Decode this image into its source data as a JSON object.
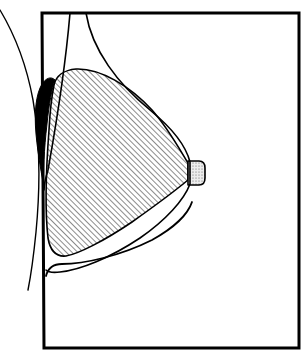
{
  "figure": {
    "domain": "Diagram",
    "background_color": "#ffffff",
    "stroke_color": "#000000",
    "canvas": {
      "width": 307,
      "height": 360
    }
  },
  "frame": {
    "label": "diagram border rectangle",
    "stroke_color": "#000000",
    "stroke_width": 3,
    "fill": "none",
    "corners": {
      "top_left": [
        42,
        13
      ],
      "top_right": [
        299,
        13
      ],
      "bottom_right": [
        299,
        348
      ],
      "bottom_left": [
        44,
        348
      ]
    }
  },
  "shapes": {
    "hatched_region": {
      "label": "hatched glandular region",
      "fill_pattern": "diagonal-hatch",
      "hatch_angle_deg": 45,
      "hatch_spacing_px": 4,
      "hatch_stroke_color": "#000000",
      "hatch_stroke_width": 0.9,
      "outline_stroke_width": 1.6,
      "path": "M 54 85 C 56 76, 64 70, 76 69 C 100 68, 130 86, 152 110 C 168 128, 180 150, 188 163 L 188 180 C 176 190, 156 205, 132 222 C 104 241, 78 254, 66 256 C 56 257, 50 250, 48 238 C 45 212, 46 170, 49 130 C 50 110, 52 95, 54 85 Z"
    },
    "black_wedge": {
      "label": "solid black crescent wedge",
      "fill": "#000000",
      "stroke": "#000000",
      "stroke_width": 1,
      "path": "M 55 80 C 52 88, 49 104, 47 124 C 44 150, 43 172, 44 188 C 42 176, 38 156, 36 134 C 34 112, 36 94, 42 84 C 46 78, 51 76, 55 80 Z"
    },
    "nipple": {
      "label": "nipple",
      "fill_pattern": "stipple-dots",
      "fill_color": "#e8e8e8",
      "dot_color": "#555555",
      "stroke_color": "#000000",
      "stroke_width": 1.6,
      "path": "M 188 161 L 199 161 C 203 161, 205 164, 205 168 L 205 178 C 205 182, 203 185, 199 185 L 188 185 Z"
    }
  },
  "curves": {
    "skin_outer_contour": {
      "label": "outer breast skin contour",
      "stroke_color": "#000000",
      "stroke_width": 1.6,
      "fill": "none",
      "path": "M 86 13 C 92 50, 118 84, 150 110 C 172 128, 186 146, 190 162 L 190 184 C 184 200, 166 220, 140 238 C 110 258, 80 270, 60 272 C 52 273, 48 272, 46 270"
    },
    "chest_wall_line": {
      "label": "chest wall vertical line",
      "stroke_color": "#000000",
      "stroke_width": 1.6,
      "fill": "none",
      "path": "M 70 13 C 66 60, 57 120, 48 170 C 45 180, 44 186, 44 190"
    },
    "torso_outer_curve": {
      "label": "outer torso silhouette curve",
      "stroke_color": "#000000",
      "stroke_width": 1.4,
      "fill": "none",
      "path": "M 0 10 C 12 30, 26 62, 33 100 C 40 140, 40 190, 36 232 C 33 262, 30 280, 28 290"
    },
    "inframammary_fold": {
      "label": "inframammary fold line",
      "stroke_color": "#000000",
      "stroke_width": 1.8,
      "fill": "none",
      "path": "M 46 276 C 48 268, 54 264, 62 264 C 84 264, 120 256, 152 240 C 174 228, 188 214, 192 202"
    }
  },
  "legend": {
    "hatched_region_meaning": "hatched area",
    "black_region_meaning": "solid black area",
    "nipple_meaning": "stippled nipple"
  }
}
